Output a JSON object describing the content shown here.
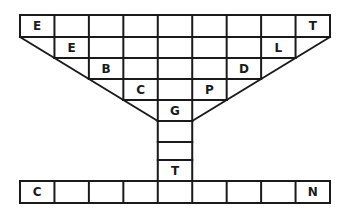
{
  "puzzle": {
    "type": "word-grid-goblet",
    "grid": {
      "left": 20,
      "right": 330,
      "columns": 9,
      "row_lines_y": [
        15,
        37,
        58,
        79,
        100,
        121
      ],
      "stem_lines_y": [
        121,
        142,
        160,
        181
      ],
      "bottom_row_y": [
        181,
        203
      ]
    },
    "letters": [
      {
        "id": "r0c0",
        "row": 0,
        "col": 0,
        "letter": "E"
      },
      {
        "id": "r0c8",
        "row": 0,
        "col": 8,
        "letter": "T"
      },
      {
        "id": "r1c1",
        "row": 1,
        "col": 1,
        "letter": "E"
      },
      {
        "id": "r1c7",
        "row": 1,
        "col": 7,
        "letter": "L"
      },
      {
        "id": "r2c2",
        "row": 2,
        "col": 2,
        "letter": "B"
      },
      {
        "id": "r2c6",
        "row": 2,
        "col": 6,
        "letter": "D"
      },
      {
        "id": "r3c3",
        "row": 3,
        "col": 3,
        "letter": "C"
      },
      {
        "id": "r3c5",
        "row": 3,
        "col": 5,
        "letter": "P"
      },
      {
        "id": "r4c4",
        "row": 4,
        "col": 4,
        "letter": "G"
      },
      {
        "id": "stem2",
        "stem": 2,
        "letter": "T"
      },
      {
        "id": "bottom0",
        "bottom": 0,
        "letter": "C"
      },
      {
        "id": "bottom8",
        "bottom": 8,
        "letter": "N"
      }
    ],
    "colors": {
      "line": "#1a1a1a",
      "background": "#ffffff"
    }
  }
}
